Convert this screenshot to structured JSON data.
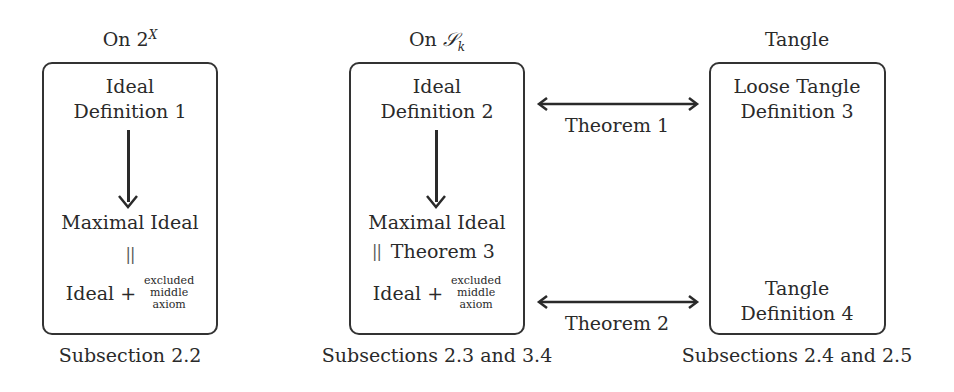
{
  "columns": [
    {
      "title": "On 2",
      "title_sup": "X",
      "box": {
        "top_line1": "Ideal",
        "top_line2": "Definition 1",
        "middle": "Maximal Ideal",
        "equals_symbol": "||",
        "equals_label": "",
        "bottom_main": "Ideal +",
        "bottom_small": [
          "excluded",
          "middle",
          "axiom"
        ]
      },
      "caption": "Subsection 2.2"
    },
    {
      "title": "On ",
      "title_script": "𝒮",
      "title_sub": "k",
      "box": {
        "top_line1": "Ideal",
        "top_line2": "Definition 2",
        "middle": "Maximal Ideal",
        "equals_symbol": "||",
        "equals_label": "Theorem 3",
        "bottom_main": "Ideal +",
        "bottom_small": [
          "excluded",
          "middle",
          "axiom"
        ]
      },
      "caption": "Subsections 2.3 and 3.4"
    },
    {
      "title": "Tangle",
      "box": {
        "top_line1": "Loose Tangle",
        "top_line2": "Definition 3",
        "bottom_line1": "Tangle",
        "bottom_line2": "Definition 4"
      },
      "caption": "Subsections 2.4 and 2.5"
    }
  ],
  "connectors": [
    {
      "label": "Theorem 1",
      "type": "double-arrow"
    },
    {
      "label": "Theorem 2",
      "type": "double-arrow"
    }
  ],
  "colors": {
    "stroke": "#2a2a2a",
    "text": "#2a2a2a",
    "background": "#ffffff"
  }
}
